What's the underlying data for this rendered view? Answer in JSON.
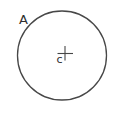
{
  "figure": {
    "type": "circle-diagram",
    "point_label": "A",
    "center_label": "c",
    "line_color": "#474747",
    "text_color": "#2e2e2e",
    "background": "#ffffff"
  }
}
